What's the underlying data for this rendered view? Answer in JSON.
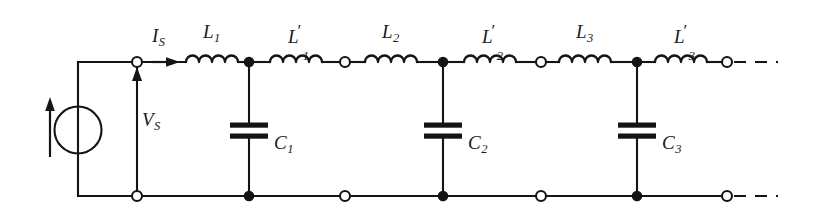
{
  "figure": {
    "type": "circuit-schematic",
    "background_color": "#ffffff",
    "line_color": "#141414"
  },
  "source": {
    "name": "current-source",
    "symbol": "circle-with-arrow",
    "arrow_direction": "up",
    "current_label": "I",
    "current_subscript": "S",
    "voltage_label": "V",
    "voltage_subscript": "S",
    "voltage_arrow_direction": "up"
  },
  "series_inductors": [
    {
      "label": "L",
      "subscript": "1",
      "prime": ""
    },
    {
      "label": "L",
      "subscript": "1",
      "prime": "′"
    },
    {
      "label": "L",
      "subscript": "2",
      "prime": ""
    },
    {
      "label": "L",
      "subscript": "2",
      "prime": "′"
    },
    {
      "label": "L",
      "subscript": "3",
      "prime": ""
    },
    {
      "label": "L",
      "subscript": "3",
      "prime": "′"
    }
  ],
  "shunt_capacitors": [
    {
      "label": "C",
      "subscript": "1"
    },
    {
      "label": "C",
      "subscript": "2"
    },
    {
      "label": "C",
      "subscript": "3"
    }
  ],
  "continuation": {
    "top": "dashed",
    "bottom": "dashed"
  },
  "labels": {
    "i_s": "I",
    "i_s_sub": "S",
    "v_s": "V",
    "v_s_sub": "S",
    "l1": "L",
    "l1_sub": "1",
    "l1p": "L",
    "l1p_sub": "1",
    "l1p_prime": "′",
    "l2": "L",
    "l2_sub": "2",
    "l2p": "L",
    "l2p_sub": "2",
    "l2p_prime": "′",
    "l3": "L",
    "l3_sub": "3",
    "l3p": "L",
    "l3p_sub": "3",
    "l3p_prime": "′",
    "c1": "C",
    "c1_sub": "1",
    "c2": "C",
    "c2_sub": "2",
    "c3": "C",
    "c3_sub": "3"
  }
}
